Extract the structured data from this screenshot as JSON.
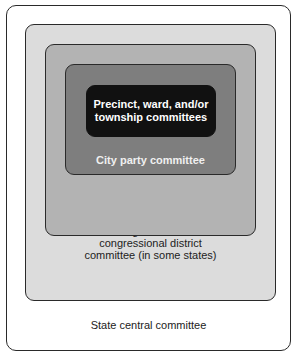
{
  "diagram": {
    "type": "nested-boxes",
    "levels": [
      {
        "label": "State central committee",
        "fill": "#ffffff"
      },
      {
        "label": "State legislative and/or congressional district committee (in some states)",
        "lines": [
          "State legislative and/or",
          "congressional district",
          "committee (in some states)"
        ],
        "fill": "#dcdcdc"
      },
      {
        "label": "County party committee",
        "fill": "#b3b3b3"
      },
      {
        "label": "City party committee",
        "fill": "#7e7e7e"
      },
      {
        "label": "Precinct, ward, and/or township committees",
        "lines": [
          "Precinct, ward, and/or",
          "township committees"
        ],
        "fill": "#111111"
      }
    ]
  }
}
